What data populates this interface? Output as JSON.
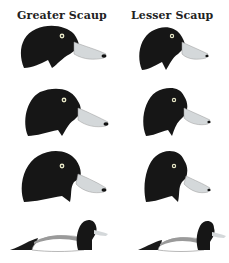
{
  "columns": [
    {
      "title": "Greater Scaup"
    },
    {
      "title": "Lesser Scaup"
    }
  ],
  "rows": [
    {
      "view": "head-profile-1"
    },
    {
      "view": "head-profile-2"
    },
    {
      "view": "head-profile-3"
    },
    {
      "view": "swimming-body"
    }
  ],
  "colors": {
    "head": "#161616",
    "bill": "#d4d8da",
    "nail": "#111111",
    "eye_ring": "#e8e8c8",
    "flank": "#ffffff",
    "back": "#9a9a9a",
    "tail": "#1a1a1a",
    "background": "#ffffff"
  }
}
